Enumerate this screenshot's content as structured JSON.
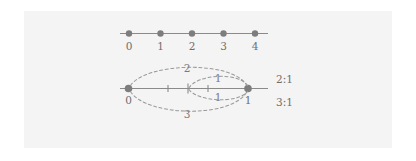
{
  "figure": {
    "background_color": "#ffffff",
    "panel_color": "#f4f4f4",
    "line_color": "#8a8a8a",
    "dot_color": "#7d7d7d",
    "arc_color": "#9a9a9a",
    "text_color": "#6e6e6e"
  },
  "top_line": {
    "name": "integer-number-line",
    "tick_labels": [
      "0",
      "1",
      "2",
      "3",
      "4"
    ],
    "point_count": 5
  },
  "bottom_line": {
    "name": "unit-interval-number-line",
    "endpoint_labels": [
      "0",
      "1"
    ],
    "interior_tick_count": 3
  },
  "arcs": [
    {
      "label": "2",
      "position": "upper-outer"
    },
    {
      "label": "1",
      "position": "upper-inner"
    },
    {
      "label": "1",
      "position": "lower-inner"
    },
    {
      "label": "3",
      "position": "lower-outer"
    }
  ],
  "ratios": [
    {
      "label": "2:1"
    },
    {
      "label": "3:1"
    }
  ]
}
